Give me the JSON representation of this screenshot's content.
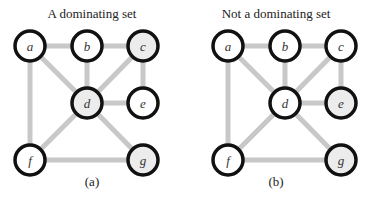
{
  "panels": [
    {
      "title": "A dominating set",
      "caption": "(a)",
      "offset_x": 0,
      "shaded_nodes": [
        "c",
        "d",
        "g"
      ]
    },
    {
      "title": "Not a dominating set",
      "caption": "(b)",
      "offset_x": 198,
      "shaded_nodes": [
        "e",
        "g"
      ]
    }
  ],
  "graph": {
    "nodes": [
      {
        "id": "a",
        "x": 30,
        "y": 46
      },
      {
        "id": "b",
        "x": 87,
        "y": 46
      },
      {
        "id": "c",
        "x": 143,
        "y": 46
      },
      {
        "id": "d",
        "x": 87,
        "y": 103
      },
      {
        "id": "e",
        "x": 143,
        "y": 103
      },
      {
        "id": "f",
        "x": 30,
        "y": 160
      },
      {
        "id": "g",
        "x": 143,
        "y": 160
      }
    ],
    "edges": [
      [
        "a",
        "b"
      ],
      [
        "b",
        "c"
      ],
      [
        "a",
        "d"
      ],
      [
        "b",
        "d"
      ],
      [
        "c",
        "d"
      ],
      [
        "c",
        "e"
      ],
      [
        "d",
        "e"
      ],
      [
        "a",
        "f"
      ],
      [
        "d",
        "f"
      ],
      [
        "d",
        "g"
      ],
      [
        "f",
        "g"
      ]
    ]
  },
  "colors": {
    "edge": "#c8c8c8",
    "node_stroke": "#111111",
    "node_fill": "#ffffff",
    "node_shaded_fill": "#ececec"
  }
}
